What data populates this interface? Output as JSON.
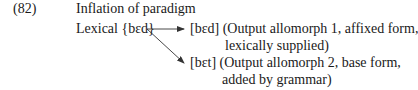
{
  "example": {
    "number": "(82)",
    "title": "Inflation of paradigm",
    "input": "Lexical {bɛd}",
    "outputs": [
      {
        "line1": "[bɛd] (Output allomorph 1, affixed form,",
        "line2": "lexically supplied)"
      },
      {
        "line1": "[bɛt] (Output allomorph 2, base form,",
        "line2": "added by grammar)"
      }
    ]
  },
  "colors": {
    "text": "#1a1a1a",
    "arrow": "#333333",
    "background": "#ffffff"
  }
}
